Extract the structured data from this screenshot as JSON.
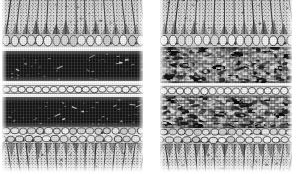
{
  "figure": {
    "background_color": "#ffffff",
    "width": 296,
    "height": 174,
    "panel_count": 2,
    "caption": ""
  },
  "palette": {
    "background": "#ffffff",
    "dark_band": "#151515",
    "mottled_band": "#6f6f6f",
    "cell_light": "#efefef",
    "cell_mid": "#bdbdbd",
    "outline": "#2b2b2b",
    "separator_white": "#fdfdfd"
  },
  "panels": [
    {
      "id": "left",
      "label": "Left panel",
      "description": "Layered section with two solid near-black bands separated by a pale cell row",
      "x": 2,
      "y": 0,
      "width": 141,
      "height": 172,
      "bands": [
        {
          "name": "upper-palisade",
          "type": "palisade",
          "top": 0,
          "height": 34,
          "direction": "down",
          "fill": "#e9e9e9"
        },
        {
          "name": "upper-cell-row",
          "type": "cellrow",
          "top": 34,
          "height": 13,
          "fill": "#dedede"
        },
        {
          "name": "upper-separator",
          "type": "separator",
          "top": 47,
          "height": 4,
          "fill": "#fdfdfd"
        },
        {
          "name": "upper-dark-band",
          "type": "dark",
          "top": 51,
          "height": 30,
          "fill": "#151515"
        },
        {
          "name": "mid-separator",
          "type": "separator",
          "top": 81,
          "height": 4,
          "fill": "#fdfdfd"
        },
        {
          "name": "mid-cell-row",
          "type": "cellrow",
          "top": 85,
          "height": 9,
          "fill": "#e4e4e4"
        },
        {
          "name": "lower-separator",
          "type": "separator",
          "top": 94,
          "height": 3,
          "fill": "#fdfdfd"
        },
        {
          "name": "lower-dark-band",
          "type": "dark",
          "top": 97,
          "height": 30,
          "fill": "#151515"
        },
        {
          "name": "lower-cell-row",
          "type": "cellrow",
          "top": 127,
          "height": 16,
          "fill": "#dedede"
        },
        {
          "name": "lower-palisade",
          "type": "palisade",
          "top": 143,
          "height": 29,
          "direction": "up",
          "fill": "#eaeaea"
        }
      ]
    },
    {
      "id": "right",
      "label": "Right panel",
      "description": "Same layered section but the two inner bands are mottled and marbled rather than solid dark",
      "x": 160,
      "y": 0,
      "width": 132,
      "height": 172,
      "bands": [
        {
          "name": "upper-palisade",
          "type": "palisade",
          "top": 0,
          "height": 34,
          "direction": "down",
          "fill": "#e9e9e9"
        },
        {
          "name": "upper-cell-row",
          "type": "cellrow",
          "top": 34,
          "height": 13,
          "fill": "#dcdcdc"
        },
        {
          "name": "upper-mottled-band",
          "type": "mottled",
          "top": 47,
          "height": 36,
          "fill": "#6f6f6f"
        },
        {
          "name": "mid-separator",
          "type": "separator",
          "top": 83,
          "height": 3,
          "fill": "#fdfdfd"
        },
        {
          "name": "mid-cell-row",
          "type": "cellrow",
          "top": 86,
          "height": 10,
          "fill": "#d8d8d8"
        },
        {
          "name": "lower-mottled-band",
          "type": "mottled",
          "top": 96,
          "height": 32,
          "fill": "#6f6f6f"
        },
        {
          "name": "lower-cell-row",
          "type": "cellrow",
          "top": 128,
          "height": 16,
          "fill": "#dcdcdc"
        },
        {
          "name": "lower-palisade",
          "type": "palisade",
          "top": 144,
          "height": 28,
          "direction": "up",
          "fill": "#eaeaea"
        }
      ]
    }
  ]
}
